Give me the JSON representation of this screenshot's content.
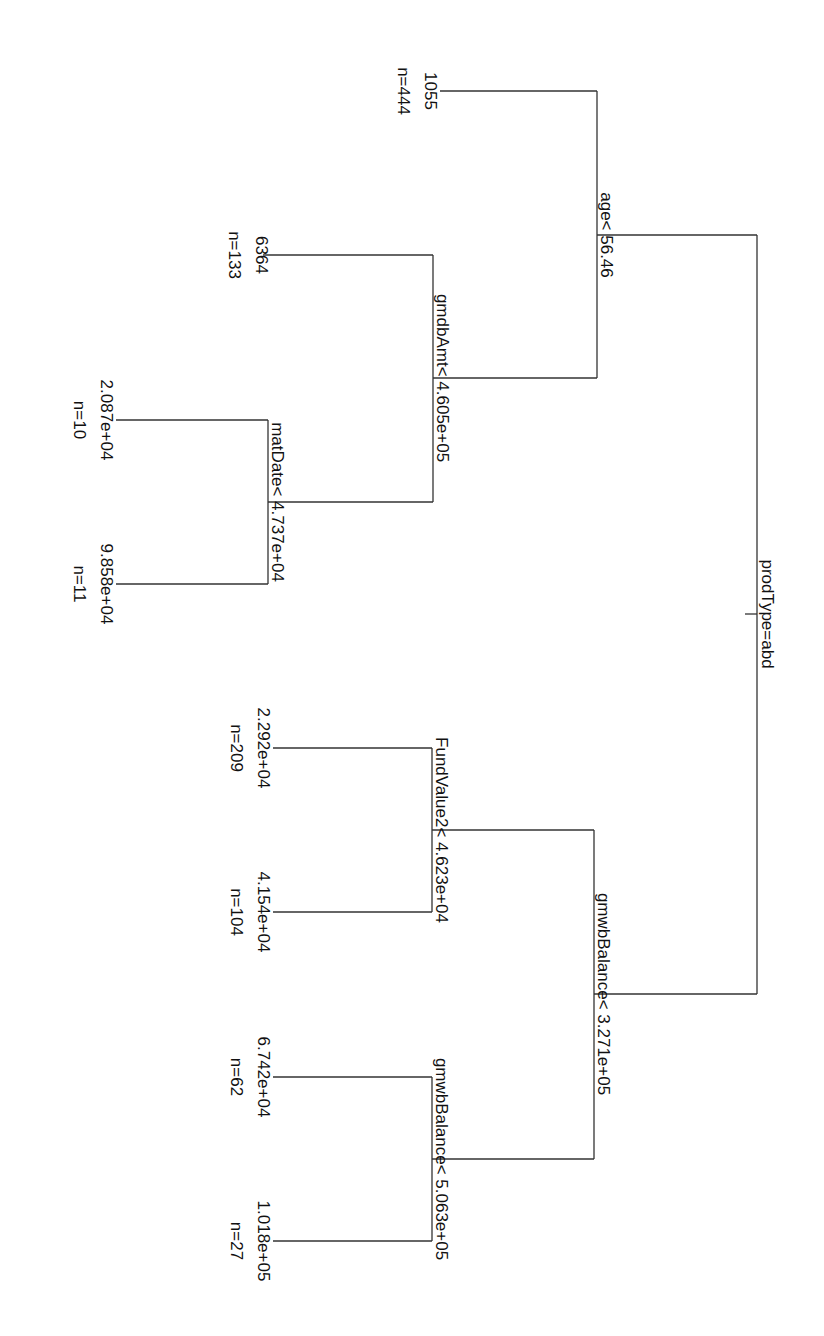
{
  "diagram": {
    "type": "regression-tree",
    "orientation": "rotated-90-clockwise",
    "line_color": "#333333",
    "text_color": "#111111",
    "root": {
      "split": "prodType=abd",
      "left": {
        "split": "age< 56.46",
        "left": {
          "leaf": true,
          "value": "1055",
          "n": "n=444"
        },
        "right": {
          "split": "gmdbAmt< 4.605e+05",
          "left": {
            "leaf": true,
            "value": "6364",
            "n": "n=133"
          },
          "right": {
            "split": "matDate< 4.737e+04",
            "left": {
              "leaf": true,
              "value": "2.087e+04",
              "n": "n=10"
            },
            "right": {
              "leaf": true,
              "value": "9.858e+04",
              "n": "n=11"
            }
          }
        }
      },
      "right": {
        "split": "gmwbBalance< 3.271e+05",
        "left": {
          "split": "FundValue2< 4.623e+04",
          "left": {
            "leaf": true,
            "value": "2.292e+04",
            "n": "n=209"
          },
          "right": {
            "leaf": true,
            "value": "4.154e+04",
            "n": "n=104"
          }
        },
        "right": {
          "split": "gmwbBalance< 5.063e+05",
          "left": {
            "leaf": true,
            "value": "6.742e+04",
            "n": "n=62"
          },
          "right": {
            "leaf": true,
            "value": "1.018e+05",
            "n": "n=27"
          }
        }
      }
    }
  },
  "labels": {
    "root_split": "prodType=abd",
    "age_split": "age< 56.46",
    "gmdbAmt_split": "gmdbAmt< 4.605e+05",
    "matDate_split": "matDate< 4.737e+04",
    "gmwb1_split": "gmwbBalance< 3.271e+05",
    "fund_split": "FundValue2< 4.623e+04",
    "gmwb2_split": "gmwbBalance< 5.063e+05",
    "leaf_1055": {
      "value": "1055",
      "n": "n=444"
    },
    "leaf_6364": {
      "value": "6364",
      "n": "n=133"
    },
    "leaf_2087": {
      "value": "2.087e+04",
      "n": "n=10"
    },
    "leaf_9858": {
      "value": "9.858e+04",
      "n": "n=11"
    },
    "leaf_2292": {
      "value": "2.292e+04",
      "n": "n=209"
    },
    "leaf_4154": {
      "value": "4.154e+04",
      "n": "n=104"
    },
    "leaf_6742": {
      "value": "6.742e+04",
      "n": "n=62"
    },
    "leaf_1018": {
      "value": "1.018e+05",
      "n": "n=27"
    }
  }
}
